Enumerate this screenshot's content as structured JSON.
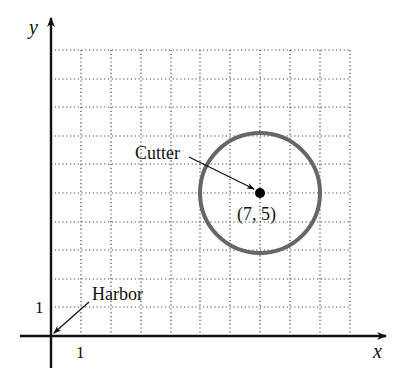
{
  "diagram": {
    "axes": {
      "x_label": "x",
      "y_label": "y",
      "x_tick_label": "1",
      "y_tick_label": "1"
    },
    "grid": {
      "x_range": [
        0,
        10
      ],
      "y_range": [
        0,
        10
      ],
      "step": 1,
      "style": "dotted"
    },
    "points": [
      {
        "name": "Harbor",
        "label": "Harbor",
        "x": 0,
        "y": 0
      },
      {
        "name": "Cutter",
        "label": "Cutter",
        "x": 7,
        "y": 5,
        "coord_label": "(7, 5)"
      }
    ],
    "circle": {
      "center_x": 7,
      "center_y": 5,
      "radius": 2,
      "color": "#666666"
    }
  }
}
